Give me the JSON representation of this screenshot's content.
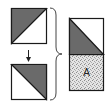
{
  "diagram": {
    "type": "quilt-block-assembly",
    "colors": {
      "dark_fill": "#6a6a6a",
      "light_fill": "#ffffff",
      "stipple_base": "#e6e6e6",
      "stroke": "#1a1a1a"
    },
    "pieces": [
      {
        "id": "top-left-square",
        "shaded": "upper-left triangle"
      },
      {
        "id": "bottom-left-square",
        "shaded": "upper-right triangle"
      },
      {
        "id": "result-rectangle",
        "top": "lower-left triangle shaded",
        "bottom": "stippled square"
      }
    ],
    "arrow": "down",
    "brace": "right-facing",
    "result_label": "A"
  }
}
